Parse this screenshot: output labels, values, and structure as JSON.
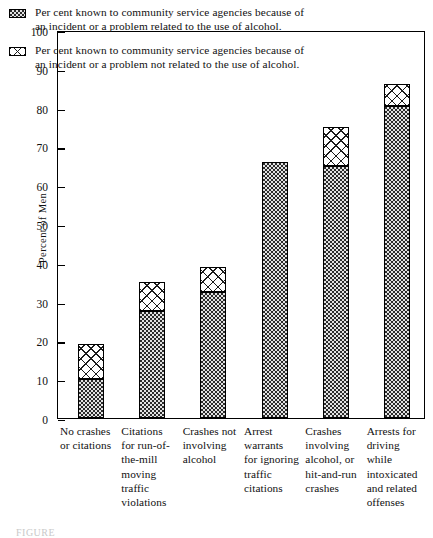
{
  "chart_data": {
    "type": "bar",
    "title": "",
    "xlabel": "",
    "ylabel": "Percent of Men",
    "ylim": [
      0,
      100
    ],
    "ytick_labels": [
      "0",
      "10",
      "20",
      "30",
      "40",
      "50",
      "60",
      "70",
      "80",
      "90",
      "100"
    ],
    "ytick_values": [
      0,
      10,
      20,
      30,
      40,
      50,
      60,
      70,
      80,
      90,
      100
    ],
    "grid": false,
    "stacked": true,
    "legend_position": "upper-left-inside",
    "categories": [
      "No crashes or citations",
      "Citations for run-of-the-mill moving traffic violations",
      "Crashes not involving alcohol",
      "Arrest warrants for ignoring traffic citations",
      "Crashes involving alcohol, or hit-and-run crashes",
      "Arrests for driving while intoxicated and related offenses"
    ],
    "series": [
      {
        "name": "Per cent known to community service agencies because of an incident or a problem related to the use of alcohol.",
        "pattern": "dots",
        "values": [
          10,
          27.5,
          32.5,
          66,
          65,
          80.5
        ]
      },
      {
        "name": "Per cent known to community service agencies because of an incident or a problem not related to the use of alcohol.",
        "pattern": "cross-hatch",
        "values": [
          9,
          7.5,
          6.5,
          0,
          10,
          5.5
        ]
      }
    ],
    "totals": [
      19,
      35,
      39,
      66,
      75,
      86
    ]
  },
  "legend": {
    "entries": [
      {
        "swatch": "dots",
        "text": "Per cent known to community service agencies because of an incident or a problem related to the use of alcohol."
      },
      {
        "swatch": "cross-hatch",
        "text": "Per cent known to community service agencies because of an incident or a problem not related to the use of alcohol."
      }
    ]
  },
  "axes": {
    "y_title": "Percent of Men",
    "y_ticks": [
      "100",
      "90",
      "80",
      "70",
      "60",
      "50",
      "40",
      "30",
      "20",
      "10",
      "0"
    ]
  },
  "x_labels": [
    "No crashes or citations",
    "Citations for run-of-the-mill moving traffic violations",
    "Crashes not involving alcohol",
    "Arrest warrants for ignoring traffic citations",
    "Crashes involving alcohol, or hit-and-run crashes",
    "Arrests for driving while intoxicated and related offenses"
  ],
  "caption": "FIGURE"
}
